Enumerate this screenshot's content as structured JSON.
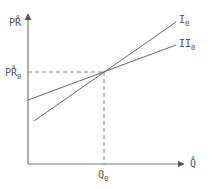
{
  "diagram": {
    "axes": {
      "y_label": "PR̊",
      "x_label": "Q̊",
      "y_mark_label": "PR̊",
      "y_mark_subscript": "0",
      "x_mark_label": "Q",
      "x_mark_subscript": "0"
    },
    "lines": [
      {
        "name": "I",
        "subscript": "0"
      },
      {
        "name": "II",
        "subscript": "0"
      }
    ],
    "colors": {
      "line": "#666666",
      "text": "#555555"
    }
  }
}
